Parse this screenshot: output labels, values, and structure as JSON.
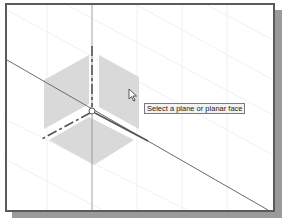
{
  "viewport": {
    "name": "3D graphics window",
    "tooltip": "Select a plane or planar face"
  },
  "colors": {
    "border": "#5a5a5a",
    "shadow": "#9a9a9a",
    "plane_fill": "#d8d8d8",
    "axis_line": "#555555",
    "grid_line": "#e6e6e6",
    "tooltip_bg": "#f2f2f2"
  },
  "icons": {
    "cursor": "arrow-cursor-icon",
    "origin": "origin-point-icon"
  }
}
